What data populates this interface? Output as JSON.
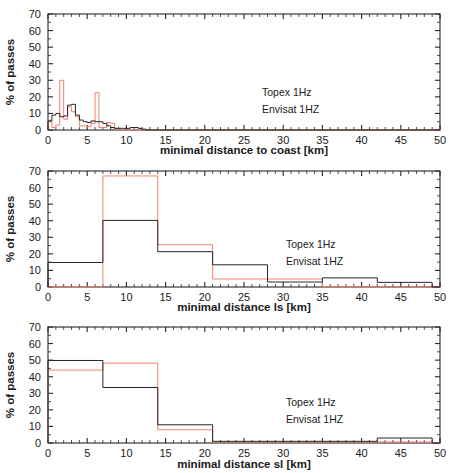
{
  "figure": {
    "colors": {
      "topex": "#f2806a",
      "envisat": "#262626",
      "axis": "#262626",
      "background": "#ffffff"
    },
    "legend": {
      "topex_label": "Topex 1Hz",
      "envisat_label": "Envisat 1HZ"
    }
  },
  "chart_data": [
    {
      "type": "bar",
      "title": "",
      "xlabel": "minimal distance to coast [km]",
      "ylabel": "% of passes",
      "xlim": [
        0,
        50
      ],
      "ylim": [
        0,
        70
      ],
      "xticks": [
        0,
        5,
        10,
        15,
        20,
        25,
        30,
        35,
        40,
        45,
        50
      ],
      "yticks": [
        0,
        10,
        20,
        30,
        40,
        50,
        60,
        70
      ],
      "xtick_labels": [
        "0",
        "5",
        "10",
        "15",
        "20",
        "25",
        "30",
        "35",
        "40",
        "45",
        "50"
      ],
      "ytick_labels": [
        "0",
        "10",
        "20",
        "30",
        "40",
        "50",
        "60",
        "70"
      ],
      "grid": false,
      "bin_width": 0.5,
      "bin_edges": [
        0,
        0.5,
        1,
        1.5,
        2,
        2.5,
        3,
        3.5,
        4,
        4.5,
        5,
        5.5,
        6,
        6.5,
        7,
        7.5,
        8,
        8.5,
        9,
        9.5,
        10,
        10.5,
        11,
        11.5,
        12,
        12.5
      ],
      "legend_position": "center-right",
      "series": [
        {
          "name": "Topex 1Hz",
          "color": "#f2806a",
          "values": [
            6,
            1.5,
            3,
            30,
            6.5,
            14,
            11,
            8,
            2.5,
            2.5,
            2,
            4,
            22.5,
            1.5,
            1.5,
            4.5,
            4,
            0.5,
            0.3,
            0,
            0,
            0,
            0,
            0,
            0
          ]
        },
        {
          "name": "Envisat 1HZ",
          "color": "#262626",
          "values": [
            5.5,
            9,
            10,
            8,
            8.5,
            15,
            15.5,
            9,
            6,
            5,
            4.5,
            5.5,
            5,
            5,
            4,
            2.5,
            1.5,
            1,
            1,
            1,
            1,
            1.5,
            1.5,
            1,
            0.5
          ]
        }
      ]
    },
    {
      "type": "bar",
      "title": "",
      "xlabel": "minimal distance ls [km]",
      "ylabel": "% of passes",
      "xlim": [
        0,
        50
      ],
      "ylim": [
        0,
        70
      ],
      "xticks": [
        0,
        5,
        10,
        15,
        20,
        25,
        30,
        35,
        40,
        45,
        50
      ],
      "yticks": [
        0,
        10,
        20,
        30,
        40,
        50,
        60,
        70
      ],
      "xtick_labels": [
        "0",
        "5",
        "10",
        "15",
        "20",
        "25",
        "30",
        "35",
        "40",
        "45",
        "50"
      ],
      "ytick_labels": [
        "0",
        "10",
        "20",
        "30",
        "40",
        "50",
        "60",
        "70"
      ],
      "grid": false,
      "bin_width": 7,
      "bin_edges": [
        0,
        7,
        14,
        21,
        28,
        35,
        42,
        49
      ],
      "legend_position": "center-right",
      "series": [
        {
          "name": "Topex 1Hz",
          "color": "#f2806a",
          "values": [
            0,
            67,
            25.5,
            4.8,
            4.8,
            0,
            0
          ]
        },
        {
          "name": "Envisat 1HZ",
          "color": "#262626",
          "values": [
            14.8,
            40.2,
            21.3,
            13.4,
            3,
            5.5,
            2.8
          ]
        }
      ]
    },
    {
      "type": "bar",
      "title": "",
      "xlabel": "minimal distance sl [km]",
      "ylabel": "% of passes",
      "xlim": [
        0,
        50
      ],
      "ylim": [
        0,
        70
      ],
      "xticks": [
        0,
        5,
        10,
        15,
        20,
        25,
        30,
        35,
        40,
        45,
        50
      ],
      "yticks": [
        0,
        10,
        20,
        30,
        40,
        50,
        60,
        70
      ],
      "xtick_labels": [
        "0",
        "5",
        "10",
        "15",
        "20",
        "25",
        "30",
        "35",
        "40",
        "45",
        "50"
      ],
      "ytick_labels": [
        "0",
        "10",
        "20",
        "30",
        "40",
        "50",
        "60",
        "70"
      ],
      "grid": false,
      "bin_width": 7,
      "bin_edges": [
        0,
        7,
        14,
        21,
        28,
        35,
        42,
        49
      ],
      "legend_position": "center-right",
      "series": [
        {
          "name": "Topex 1Hz",
          "color": "#f2806a",
          "values": [
            44,
            48.2,
            8,
            0.6,
            0.6,
            0.6,
            0.6
          ]
        },
        {
          "name": "Envisat 1HZ",
          "color": "#262626",
          "values": [
            49.8,
            33.5,
            11,
            1,
            1,
            1,
            3
          ]
        }
      ]
    }
  ]
}
